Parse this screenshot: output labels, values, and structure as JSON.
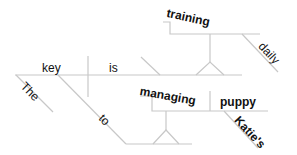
{
  "diagram": {
    "type": "sentence-diagram",
    "sentence_words": [
      "The",
      "key",
      "to",
      "managing",
      "Katie's",
      "puppy",
      "is",
      "training",
      "daily"
    ],
    "words": {
      "subject": "key",
      "subject_modifier": "The",
      "verb": "is",
      "preposition": "to",
      "gerund_object_of_preposition": "managing",
      "gerund_object": "puppy",
      "object_modifier": "Katie's",
      "predicate_nominative": "training",
      "predicate_modifier": "daily"
    },
    "line_color": "#c8c8c8",
    "text_color": "#111111"
  }
}
